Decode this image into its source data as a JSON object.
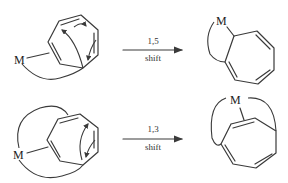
{
  "diagram": {
    "type": "reaction-scheme",
    "reactions": [
      {
        "id": "top",
        "reactant_atom": "M",
        "arrow_label_top": "1,5",
        "arrow_label_bottom": "shift",
        "product_atom": "M"
      },
      {
        "id": "bottom",
        "reactant_atom": "M",
        "arrow_label_top": "1,3",
        "arrow_label_bottom": "shift",
        "product_atom": "M"
      }
    ],
    "colors": {
      "ink": "#3a3a3a",
      "background": "#ffffff"
    }
  }
}
